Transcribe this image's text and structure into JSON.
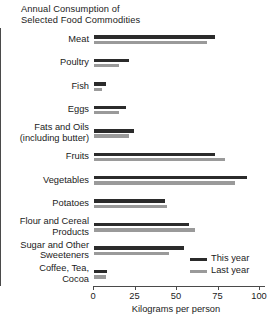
{
  "chart_data": {
    "type": "bar",
    "orientation": "horizontal",
    "title": "Annual Consumption of\nSelected Food Commodities",
    "xlabel": "Kilograms per person",
    "ylabel": "",
    "xlim": [
      0,
      100
    ],
    "xticks": [
      0,
      25,
      50,
      75,
      100
    ],
    "xtick_labels": [
      "0",
      "25",
      "50",
      "75",
      "100"
    ],
    "grid": false,
    "legend_position": "bottom-right",
    "categories": [
      "Meat",
      "Poultry",
      "Fish",
      "Eggs",
      "Fats and Oils\n(including butter)",
      "Fruits",
      "Vegetables",
      "Potatoes",
      "Flour and Cereal\nProducts",
      "Sugar and Other\nSweeteners",
      "Coffee, Tea,\nCocoa"
    ],
    "series": [
      {
        "name": "This year",
        "color": "#2b2b2b",
        "values": [
          73,
          21,
          7,
          19,
          24,
          73,
          92,
          43,
          57,
          54,
          8
        ]
      },
      {
        "name": "Last year",
        "color": "#9a9a9a",
        "values": [
          68,
          15,
          5,
          15,
          21,
          79,
          85,
          44,
          61,
          45,
          7
        ]
      }
    ]
  }
}
